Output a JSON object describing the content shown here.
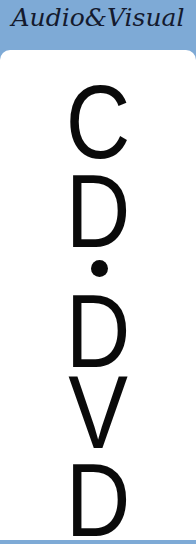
{
  "header": {
    "title": "Audio&Visual",
    "background_color": "#7eaad6",
    "text_color": "#141a2e"
  },
  "sign": {
    "background_color": "#ffffff",
    "text_color": "#0a0a0a",
    "letters": [
      "C",
      "D",
      "•",
      "D",
      "V",
      "D"
    ],
    "line1": "C",
    "line2": "D",
    "separator": "•",
    "line3": "D",
    "line4": "V",
    "line5": "D"
  }
}
